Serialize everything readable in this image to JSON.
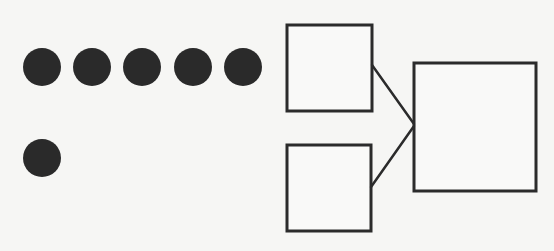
{
  "diagram": {
    "background": "#f6f6f4",
    "stroke_color": "#2b2b2b",
    "fill_color": "#2a2a2a",
    "dots_row1": [
      {
        "cx": 42,
        "cy": 67,
        "r": 19
      },
      {
        "cx": 92,
        "cy": 67,
        "r": 19
      },
      {
        "cx": 142,
        "cy": 67,
        "r": 19
      },
      {
        "cx": 193,
        "cy": 67,
        "r": 19
      },
      {
        "cx": 243,
        "cy": 67,
        "r": 19
      }
    ],
    "dots_row2": [
      {
        "cx": 42,
        "cy": 158,
        "r": 19
      }
    ],
    "boxes": [
      {
        "id": "input-box-top",
        "x": 287,
        "y": 25,
        "w": 85,
        "h": 86
      },
      {
        "id": "input-box-bottom",
        "x": 287,
        "y": 145,
        "w": 84,
        "h": 86
      },
      {
        "id": "output-box",
        "x": 414,
        "y": 63,
        "w": 122,
        "h": 128
      }
    ],
    "connectors": [
      {
        "x1": 372,
        "y1": 65,
        "x2": 414,
        "y2": 124
      },
      {
        "x1": 371,
        "y1": 187,
        "x2": 414,
        "y2": 126
      }
    ]
  }
}
